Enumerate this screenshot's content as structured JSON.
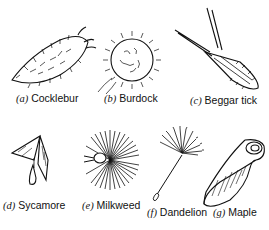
{
  "figure": {
    "panels": [
      {
        "letter": "(a)",
        "name": "Cocklebur",
        "icon": "cocklebur-seed-icon"
      },
      {
        "letter": "(b)",
        "name": "Burdock",
        "icon": "burdock-seed-icon"
      },
      {
        "letter": "(c)",
        "name": "Beggar tick",
        "icon": "beggar-tick-seed-icon"
      },
      {
        "letter": "(d)",
        "name": "Sycamore",
        "icon": "sycamore-seed-icon"
      },
      {
        "letter": "(e)",
        "name": "Milkweed",
        "icon": "milkweed-seed-icon"
      },
      {
        "letter": "(f)",
        "name": "Dandelion",
        "icon": "dandelion-seed-icon"
      },
      {
        "letter": "(g)",
        "name": "Maple",
        "icon": "maple-seed-icon"
      }
    ]
  }
}
